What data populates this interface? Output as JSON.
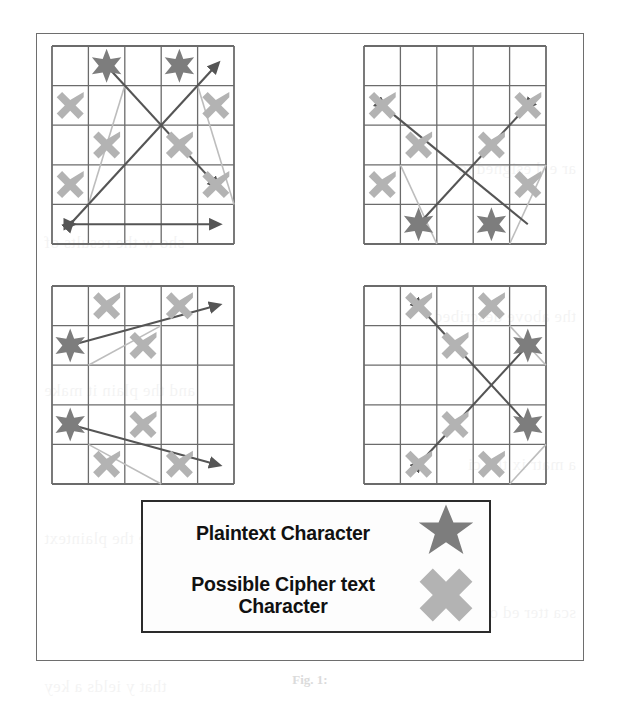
{
  "figure": {
    "caption": "Fig. 1:",
    "frame": {
      "x": 36,
      "y": 33,
      "width": 548,
      "height": 628
    }
  },
  "colors": {
    "plaintext_star": "#7d7d7d",
    "ciphertext_x": "#b3b3b3",
    "grid_line": "#6b6b6b",
    "arrow_dark": "#555555",
    "arrow_light": "#bdbdbd",
    "frame": "#6e6e6e",
    "legend_border": "#2b2b2b",
    "text": "#111111"
  },
  "legend": {
    "rows": [
      {
        "label": "Plaintext Character",
        "marker": "star-icon"
      },
      {
        "label": "Possible Cipher text Character",
        "marker": "cross-x-icon"
      }
    ]
  },
  "grids": [
    {
      "name": "grid-top-left",
      "position": {
        "x": 52,
        "y": 46
      },
      "size": {
        "width": 182,
        "height": 198
      },
      "rows": 5,
      "cols": 5,
      "dark_arrows": [
        {
          "from": [
            0,
            4
          ],
          "to": [
            4,
            0
          ],
          "head": "both"
        },
        {
          "from": [
            1,
            0
          ],
          "to": [
            4,
            3
          ],
          "head": "end"
        },
        {
          "from": [
            0,
            4
          ],
          "to": [
            4,
            4
          ],
          "head": "both"
        }
      ],
      "light_arrows": [
        {
          "from": [
            0.5,
            3.5
          ],
          "to": [
            1.5,
            0.5
          ],
          "head": "none"
        },
        {
          "from": [
            3.5,
            0.5
          ],
          "to": [
            4.5,
            3.5
          ],
          "head": "none"
        }
      ],
      "stars": [
        [
          1,
          0
        ],
        [
          3,
          0
        ]
      ],
      "crosses": [
        [
          0,
          1
        ],
        [
          4,
          1
        ],
        [
          1,
          2
        ],
        [
          3,
          2
        ],
        [
          0,
          3
        ],
        [
          4,
          3
        ]
      ]
    },
    {
      "name": "grid-top-right",
      "position": {
        "x": 364,
        "y": 46
      },
      "size": {
        "width": 182,
        "height": 198
      },
      "rows": 5,
      "cols": 5,
      "dark_arrows": [
        {
          "from": [
            0,
            1
          ],
          "to": [
            4,
            4
          ],
          "head": "start"
        },
        {
          "from": [
            4,
            1
          ],
          "to": [
            1,
            4
          ],
          "head": "start"
        }
      ],
      "light_arrows": [
        {
          "from": [
            0.5,
            2.5
          ],
          "to": [
            1.5,
            4.5
          ],
          "head": "none"
        },
        {
          "from": [
            3.5,
            4.5
          ],
          "to": [
            4.5,
            2.5
          ],
          "head": "none"
        }
      ],
      "stars": [
        [
          1,
          4
        ],
        [
          3,
          4
        ]
      ],
      "crosses": [
        [
          0,
          1
        ],
        [
          4,
          1
        ],
        [
          1,
          2
        ],
        [
          3,
          2
        ],
        [
          0,
          3
        ],
        [
          4,
          3
        ]
      ]
    },
    {
      "name": "grid-bottom-left",
      "position": {
        "x": 52,
        "y": 286
      },
      "size": {
        "width": 182,
        "height": 198
      },
      "rows": 5,
      "cols": 5,
      "dark_arrows": [
        {
          "from": [
            0,
            1
          ],
          "to": [
            4,
            0
          ],
          "head": "end"
        },
        {
          "from": [
            0,
            3
          ],
          "to": [
            4,
            4
          ],
          "head": "end"
        }
      ],
      "light_arrows": [
        {
          "from": [
            0.5,
            1.5
          ],
          "to": [
            2.5,
            0.5
          ],
          "head": "none"
        },
        {
          "from": [
            0.5,
            3.5
          ],
          "to": [
            2.5,
            4.5
          ],
          "head": "none"
        }
      ],
      "stars": [
        [
          0,
          1
        ],
        [
          0,
          3
        ]
      ],
      "crosses": [
        [
          1,
          0
        ],
        [
          3,
          0
        ],
        [
          2,
          1
        ],
        [
          2,
          3
        ],
        [
          1,
          4
        ],
        [
          3,
          4
        ]
      ]
    },
    {
      "name": "grid-bottom-right",
      "position": {
        "x": 364,
        "y": 286
      },
      "size": {
        "width": 182,
        "height": 198
      },
      "rows": 5,
      "cols": 5,
      "dark_arrows": [
        {
          "from": [
            1,
            0
          ],
          "to": [
            4,
            3
          ],
          "head": "start"
        },
        {
          "from": [
            1,
            4
          ],
          "to": [
            4,
            1
          ],
          "head": "start"
        }
      ],
      "light_arrows": [
        {
          "from": [
            3.5,
            0.5
          ],
          "to": [
            4.5,
            1.5
          ],
          "head": "none"
        },
        {
          "from": [
            3.5,
            4.5
          ],
          "to": [
            4.5,
            3.5
          ],
          "head": "none"
        }
      ],
      "stars": [
        [
          4,
          1
        ],
        [
          4,
          3
        ]
      ],
      "crosses": [
        [
          1,
          0
        ],
        [
          3,
          0
        ],
        [
          2,
          1
        ],
        [
          2,
          3
        ],
        [
          1,
          4
        ],
        [
          3,
          4
        ]
      ]
    }
  ],
  "background_bleed": [
    "ar e d esigned to",
    "sho w the results of",
    "the above described",
    "and the plain it make",
    "a matr ix the ci",
    "possible the plaintext",
    "sca tter ed over",
    "that y ields a key"
  ]
}
